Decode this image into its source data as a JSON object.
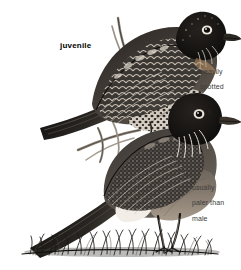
{
  "plate": {
    "subject": "American Robin",
    "background_color": "#ffffff",
    "ink_color": "#1a1a1a",
    "annotation_color": "#3b3b3b",
    "width": 241,
    "height": 270
  },
  "labels": {
    "juvenile": "juvenile",
    "heavily_spotted_line1": "heavily",
    "heavily_spotted_line2": "spotted",
    "paler_line1": "usually",
    "paler_line2": "paler than",
    "paler_line3": "male",
    "female_symbol": "♀"
  },
  "figures": [
    {
      "name": "juvenile-robin",
      "pose": "perched on branch, facing right, upper bird",
      "features": [
        "dark spotted head",
        "white eye-ring",
        "heavily spotted buff breast",
        "scalloped pale-edged wing coverts",
        "long dark tail to lower-left"
      ]
    },
    {
      "name": "adult-female-robin",
      "pose": "standing on grass, facing right, lower bird",
      "features": [
        "blackish head",
        "white eye-arcs",
        "streaked white throat",
        "gray-brown back and wings",
        "paler orange breast",
        "long dark tail to lower-left",
        "pale legs"
      ]
    }
  ],
  "scene": {
    "ground": "tuft of grass along the bottom",
    "perch": "bare twig / branch behind the juvenile"
  }
}
